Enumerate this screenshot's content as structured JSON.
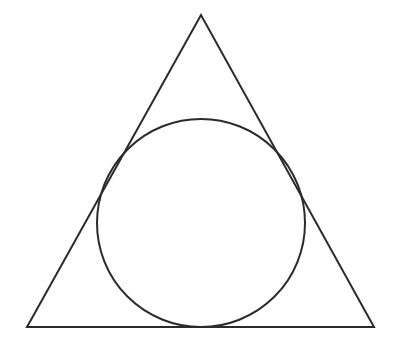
{
  "diagram": {
    "stroke_color": "#2b2b2b",
    "background": "#ffffff",
    "triangle": {
      "points": [
        [
          201,
          15
        ],
        [
          27,
          327
        ],
        [
          374,
          327
        ]
      ]
    },
    "incircle": {
      "cx": 201,
      "cy": 223,
      "r": 104
    }
  }
}
